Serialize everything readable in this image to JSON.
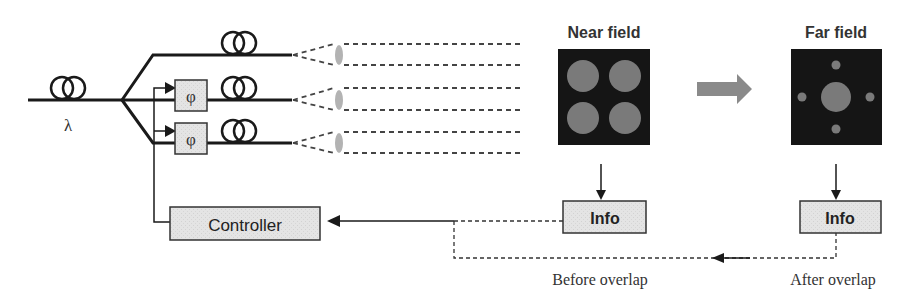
{
  "diagram": {
    "source": {
      "label": "λ"
    },
    "phase_modulators": [
      {
        "label": "φ"
      },
      {
        "label": "φ"
      }
    ],
    "controller": {
      "label": "Controller"
    },
    "near_field": {
      "title": "Near field",
      "info_label": "Info"
    },
    "far_field": {
      "title": "Far field",
      "info_label": "Info"
    },
    "captions": {
      "before": "Before overlap",
      "after": "After overlap"
    },
    "colors": {
      "line": "#1a1a1a",
      "box_fill": "#e6e6e6",
      "lens": "#b3b3b3",
      "field_bg": "#151515",
      "spot": "#7a7a7a",
      "arrow": "#8a8a8a"
    }
  }
}
